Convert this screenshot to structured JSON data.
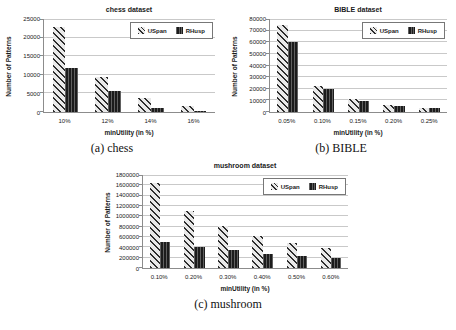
{
  "style": {
    "background": "#ffffff",
    "text_color": "#1a1a1a",
    "grid_color": "#c9c9c9",
    "axis_color": "#8c8c8c",
    "legend_border": "#777777",
    "uspan_hatch_color": "#2e2e2e",
    "uspan_fill_color": "#e9e9e9",
    "rhusp_fill_color": "#1c1c1c",
    "rhusp_stripe_color": "#606060"
  },
  "figures": [
    {
      "caption": "(a) chess"
    },
    {
      "caption": "(b) BIBLE"
    },
    {
      "caption": "(c) mushroom"
    }
  ],
  "chart_data": [
    {
      "type": "bar",
      "title": "chess dataset",
      "xlabel": "minUtility (in %)",
      "ylabel": "Number of Patterns",
      "categories": [
        "10%",
        "12%",
        "14%",
        "16%"
      ],
      "series": [
        {
          "name": "USpan",
          "values": [
            22800,
            9400,
            3700,
            1500
          ]
        },
        {
          "name": "RHusp",
          "values": [
            11800,
            5600,
            1000,
            400
          ]
        }
      ],
      "ylim": [
        0,
        25000
      ],
      "ytick_step": 5000,
      "grid": true,
      "legend_position": "top-right"
    },
    {
      "type": "bar",
      "title": "BIBLE dataset",
      "xlabel": "minUtility (in %)",
      "ylabel": "Number of Patterns",
      "categories": [
        "0.05%",
        "0.10%",
        "0.15%",
        "0.20%",
        "0.25%"
      ],
      "series": [
        {
          "name": "USpan",
          "values": [
            74500,
            22800,
            10800,
            5800,
            3400
          ]
        },
        {
          "name": "RHusp",
          "values": [
            60000,
            20000,
            9900,
            5100,
            3200
          ]
        }
      ],
      "ylim": [
        0,
        80000
      ],
      "ytick_step": 10000,
      "grid": true,
      "legend_position": "top-right"
    },
    {
      "type": "bar",
      "title": "mushroom dataset",
      "xlabel": "minUtility (in %)",
      "ylabel": "Number of Patterns",
      "categories": [
        "0.10%",
        "0.20%",
        "0.30%",
        "0.40%",
        "0.50%",
        "0.60%"
      ],
      "series": [
        {
          "name": "USpan",
          "values": [
            1640000,
            1110000,
            810000,
            610000,
            480000,
            395000
          ]
        },
        {
          "name": "RHusp",
          "values": [
            500000,
            410000,
            340000,
            280000,
            235000,
            195000
          ]
        }
      ],
      "ylim": [
        0,
        1800000
      ],
      "ytick_step": 200000,
      "grid": true,
      "legend_position": "top-right"
    }
  ]
}
